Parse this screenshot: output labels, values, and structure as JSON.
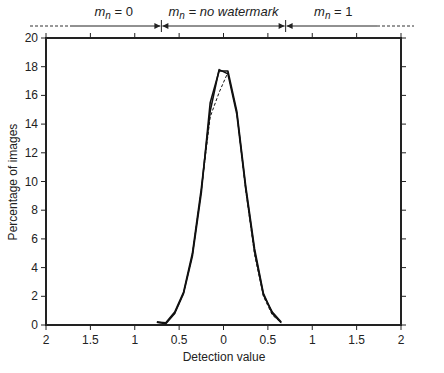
{
  "chart_data": {
    "type": "line",
    "title": "",
    "xlabel": "Detection value",
    "ylabel": "Percentage of images",
    "xlim": [
      -2,
      2
    ],
    "ylim": [
      0,
      20
    ],
    "x_tick_values": [
      -2,
      -1.5,
      -1,
      -0.5,
      0,
      0.5,
      1,
      1.5,
      2
    ],
    "x_tick_labels": [
      "2",
      "1.5",
      "1",
      "0.5",
      "0",
      "0.5",
      "1",
      "1.5",
      "2"
    ],
    "y_tick_values": [
      0,
      2,
      4,
      6,
      8,
      10,
      12,
      14,
      16,
      18,
      20
    ],
    "y_tick_labels": [
      "0",
      "2",
      "4",
      "6",
      "8",
      "10",
      "12",
      "14",
      "16",
      "18",
      "20"
    ],
    "grid": false,
    "legend": null,
    "regions": [
      {
        "label_var": "m",
        "label_sub": "n",
        "label_rest": " = 0",
        "x_from": -2.0,
        "x_to": -0.7
      },
      {
        "label_var": "m",
        "label_sub": "n",
        "label_rest": " = no watermark",
        "x_from": -0.7,
        "x_to": 0.7
      },
      {
        "label_var": "m",
        "label_sub": "n",
        "label_rest": " = 1",
        "x_from": 0.7,
        "x_to": 2.0
      }
    ],
    "series": [
      {
        "name": "solid-curve-a",
        "style": "solid",
        "x": [
          -0.75,
          -0.65,
          -0.55,
          -0.45,
          -0.35,
          -0.25,
          -0.15,
          -0.05,
          0.05,
          0.15,
          0.25,
          0.35,
          0.45,
          0.55,
          0.65
        ],
        "y": [
          0.2,
          0.15,
          0.9,
          2.3,
          5.0,
          9.5,
          14.9,
          17.8,
          17.5,
          14.7,
          9.5,
          5.1,
          2.1,
          0.9,
          0.2
        ]
      },
      {
        "name": "solid-curve-b",
        "style": "solid",
        "x": [
          -0.75,
          -0.65,
          -0.55,
          -0.45,
          -0.35,
          -0.25,
          -0.15,
          -0.05,
          0.05,
          0.15,
          0.25,
          0.35,
          0.45,
          0.55,
          0.65
        ],
        "y": [
          0.2,
          0.1,
          0.8,
          2.2,
          4.8,
          9.2,
          15.5,
          17.7,
          17.7,
          14.9,
          9.7,
          5.3,
          2.2,
          0.8,
          0.15
        ]
      },
      {
        "name": "dashed-curve",
        "style": "dashed",
        "x": [
          -0.75,
          -0.65,
          -0.55,
          -0.45,
          -0.35,
          -0.25,
          -0.15,
          -0.05,
          0.05,
          0.15,
          0.25,
          0.35,
          0.45,
          0.55,
          0.65
        ],
        "y": [
          0.2,
          0.1,
          0.8,
          2.2,
          4.9,
          9.4,
          14.5,
          16.2,
          17.6,
          14.8,
          9.4,
          4.9,
          2.0,
          0.7,
          0.15
        ]
      }
    ]
  }
}
